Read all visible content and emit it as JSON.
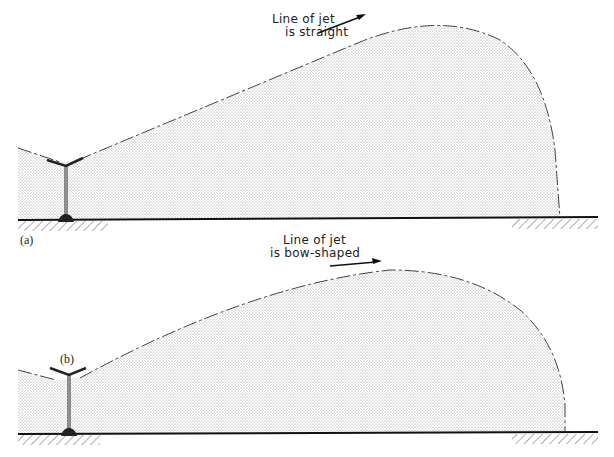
{
  "figure": {
    "panel_a": {
      "caption": "(a)",
      "annotation_line1": "Line of jet",
      "annotation_line2": "is straight"
    },
    "panel_b": {
      "caption": "(b)",
      "annotation_line1": "Line of jet",
      "annotation_line2": "is bow-shaped"
    },
    "colors": {
      "line": "#222222",
      "stipple": "#9a9a9a",
      "background": "#ffffff"
    }
  }
}
